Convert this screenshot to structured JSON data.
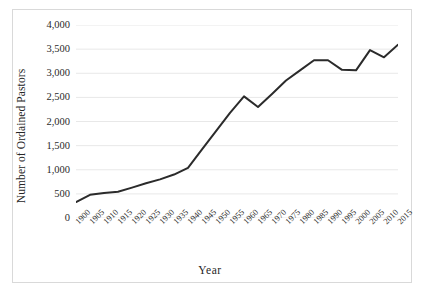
{
  "chart_data": {
    "type": "line",
    "title": "",
    "xlabel": "Year",
    "ylabel": "Number of Ordained Pastors",
    "x": [
      1900,
      1905,
      1910,
      1915,
      1920,
      1925,
      1930,
      1935,
      1940,
      1945,
      1950,
      1955,
      1960,
      1965,
      1970,
      1975,
      1980,
      1985,
      1990,
      1995,
      2000,
      2005,
      2010,
      2015
    ],
    "categories": [
      "1900",
      "1905",
      "1910",
      "1915",
      "1920",
      "1925",
      "1930",
      "1935",
      "1940",
      "1945",
      "1950",
      "1955",
      "1960",
      "1965",
      "1970",
      "1975",
      "1980",
      "1985",
      "1990",
      "1995",
      "2000",
      "2005",
      "2010",
      "2015"
    ],
    "values": [
      330,
      480,
      520,
      545,
      630,
      720,
      800,
      900,
      1040,
      1420,
      1800,
      2180,
      2520,
      2300,
      2570,
      2850,
      3060,
      3270,
      3270,
      3070,
      3060,
      3480,
      3330,
      3590
    ],
    "series": [
      {
        "name": "Ordained Pastors",
        "color": "#2b2b2b",
        "values": [
          330,
          480,
          520,
          545,
          630,
          720,
          800,
          900,
          1040,
          1420,
          1800,
          2180,
          2520,
          2300,
          2570,
          2850,
          3060,
          3270,
          3270,
          3070,
          3060,
          3480,
          3330,
          3590
        ]
      }
    ],
    "ylim": [
      0,
      4000
    ],
    "ytick_step": 500,
    "ytick_labels": [
      "4,000",
      "3,500",
      "3,000",
      "2,500",
      "2,000",
      "1,500",
      "1,000",
      "500",
      "0"
    ],
    "ytick_values": [
      4000,
      3500,
      3000,
      2500,
      2000,
      1500,
      1000,
      500,
      0
    ],
    "grid": true,
    "grid_color": "#e8e8e8",
    "legend": false,
    "legend_position": "none",
    "line_width": 2,
    "markers": false,
    "xtick_rotation": -45,
    "background": "#ffffff",
    "border_color": "#d9d9d9",
    "annotations": []
  }
}
